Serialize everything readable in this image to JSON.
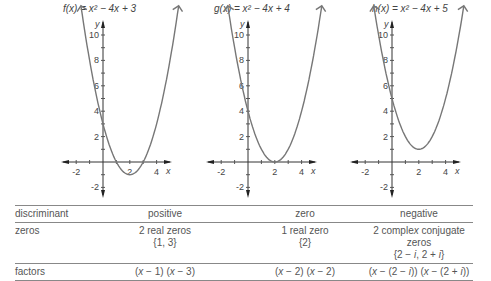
{
  "graphs": [
    {
      "title": "f(x) = x² − 4x + 3",
      "a": 1,
      "b": -4,
      "c": 3,
      "vertex": [
        2,
        -1
      ],
      "zeros": [
        1,
        3
      ]
    },
    {
      "title": "g(x) = x² − 4x + 4",
      "a": 1,
      "b": -4,
      "c": 4,
      "vertex": [
        2,
        0
      ],
      "zeros": [
        2
      ]
    },
    {
      "title": "h(x) = x² − 4x + 5",
      "a": 1,
      "b": -4,
      "c": 5,
      "vertex": [
        2,
        1
      ],
      "zeros": []
    }
  ],
  "axes": {
    "x_label": "x",
    "y_label": "y",
    "x_ticks": [
      "-2",
      "2",
      "4"
    ],
    "y_ticks": [
      "10",
      "8",
      "6",
      "4",
      "2",
      "-2"
    ]
  },
  "table": {
    "rows": [
      {
        "label": "discriminant",
        "cells": [
          [
            "positive"
          ],
          [
            "zero"
          ],
          [
            "negative"
          ]
        ]
      },
      {
        "label": "zeros",
        "cells": [
          [
            "2 real zeros",
            "{1, 3}"
          ],
          [
            "1 real zero",
            "{2}"
          ],
          [
            "2 complex conjugate zeros",
            "{2 − i, 2 + i}"
          ]
        ]
      },
      {
        "label": "factors",
        "cells": [
          [
            "(x − 1) (x − 3)"
          ],
          [
            "(x − 2) (x − 2)"
          ],
          [
            "(x − (2 − i)) (x − (2 + i))"
          ]
        ]
      }
    ]
  },
  "chart_data": {
    "type": "line",
    "series": [
      {
        "name": "f(x) = x^2 - 4x + 3",
        "x": [
          -1,
          0,
          1,
          2,
          3,
          4,
          5
        ],
        "y": [
          8,
          3,
          0,
          -1,
          0,
          3,
          8
        ]
      },
      {
        "name": "g(x) = x^2 - 4x + 4",
        "x": [
          -1,
          0,
          1,
          2,
          3,
          4,
          5
        ],
        "y": [
          9,
          4,
          1,
          0,
          1,
          4,
          9
        ]
      },
      {
        "name": "h(x) = x^2 - 4x + 5",
        "x": [
          -1,
          0,
          1,
          2,
          3,
          4,
          5
        ],
        "y": [
          10,
          5,
          2,
          1,
          2,
          5,
          10
        ]
      }
    ],
    "xlabel": "x",
    "ylabel": "y",
    "xlim": [
      -2.5,
      5
    ],
    "ylim": [
      -2.5,
      10.5
    ],
    "grid": false
  }
}
